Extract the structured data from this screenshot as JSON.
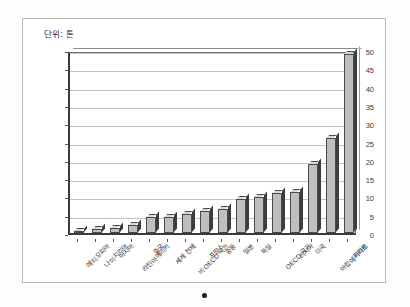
{
  "document": {
    "unit_caption": "단위: 톤",
    "bullet_marker": "bullet-dot"
  },
  "chart_data": {
    "type": "bar",
    "title": "단위: 톤",
    "xlabel": "",
    "ylabel": "",
    "ylim": [
      0,
      50
    ],
    "ytick_step": 5,
    "yticks": [
      0,
      5,
      10,
      15,
      20,
      25,
      30,
      35,
      40,
      45,
      50
    ],
    "grid": true,
    "legend": "none",
    "bar_color": "#bfbfbf",
    "bar_edge_color": "#4a4a4a",
    "categories": [
      "에티오피아",
      "나이지리아",
      "아시아",
      "라틴아메리카",
      "중국",
      "세계 전체",
      "비 OECD 국가",
      "프랑스",
      "중동",
      "일본",
      "독일",
      "OECD 국가",
      "러시아",
      "미국",
      "아랍에미리트",
      "카타르"
    ],
    "values": [
      0.3,
      1.0,
      1.3,
      2.2,
      4.3,
      4.3,
      5.1,
      5.9,
      6.5,
      9.3,
      9.8,
      10.8,
      11.1,
      18.9,
      25.9,
      48.9
    ]
  }
}
